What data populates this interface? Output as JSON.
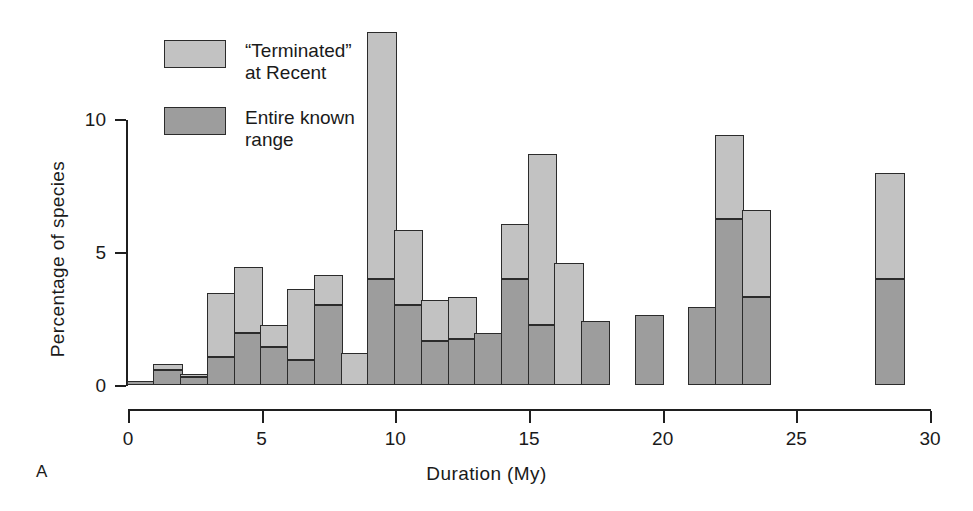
{
  "figure": {
    "panel_label": "A",
    "xlabel": "Duration (My)",
    "ylabel": "Percentage of species"
  },
  "legend": {
    "position": "top-left",
    "items": [
      {
        "label": "“Terminated”\nat Recent",
        "color": "#c2c2c2",
        "key": "terminated"
      },
      {
        "label": "Entire known\nrange",
        "color": "#9d9d9d",
        "key": "entire"
      }
    ]
  },
  "axes": {
    "x": {
      "ticks": [
        "0",
        "5",
        "10",
        "15",
        "20",
        "25",
        "30"
      ],
      "min": 0,
      "max": 30
    },
    "y": {
      "ticks": [
        "0",
        "5",
        "10"
      ],
      "min": 0,
      "max": 14.5
    }
  },
  "chart_data": {
    "type": "bar",
    "title": "",
    "xlabel": "Duration (My)",
    "ylabel": "Percentage of species",
    "xlim": [
      0,
      30
    ],
    "ylim": [
      0,
      14.5
    ],
    "grid": false,
    "legend_position": "top-left",
    "stacked": true,
    "bin_width": 1,
    "categories": [
      "0-1",
      "1-2",
      "2-3",
      "3-4",
      "4-5",
      "5-6",
      "6-7",
      "7-8",
      "8-9",
      "9-10",
      "10-11",
      "11-12",
      "12-13",
      "13-14",
      "14-15",
      "15-16",
      "16-17",
      "17-18",
      "18-19",
      "19-20",
      "20-21",
      "21-22",
      "22-23",
      "23-24",
      "24-25",
      "25-26",
      "26-27",
      "27-28",
      "28-29",
      "29-30"
    ],
    "bin_starts": [
      0,
      1,
      2,
      3,
      4,
      5,
      6,
      7,
      8,
      9,
      10,
      11,
      12,
      13,
      14,
      15,
      16,
      17,
      18,
      19,
      20,
      21,
      22,
      23,
      24,
      25,
      26,
      27,
      28,
      29
    ],
    "series": [
      {
        "name": "Entire known range",
        "color": "#9d9d9d",
        "values": [
          0.15,
          0.55,
          0.3,
          1.05,
          1.95,
          1.45,
          0.95,
          3.0,
          0,
          4.0,
          3.0,
          1.65,
          1.75,
          1.95,
          4.0,
          2.25,
          0,
          2.4,
          0,
          2.65,
          0,
          2.95,
          6.25,
          3.3,
          0,
          0,
          0,
          0,
          4.0,
          0
        ]
      },
      {
        "name": "“Terminated” at Recent",
        "color": "#c2c2c2",
        "values": [
          0,
          0.25,
          0.1,
          2.4,
          2.5,
          0.8,
          2.65,
          1.15,
          1.2,
          9.3,
          2.85,
          1.55,
          1.55,
          0,
          2.05,
          6.45,
          4.6,
          0,
          0,
          0,
          0,
          0,
          3.15,
          3.3,
          0,
          0,
          0,
          0,
          4.0,
          0
        ]
      }
    ],
    "totals": [
      0.15,
      0.8,
      0.4,
      3.45,
      4.45,
      2.25,
      3.6,
      4.15,
      1.2,
      13.3,
      5.85,
      3.2,
      3.3,
      1.95,
      6.05,
      8.7,
      4.6,
      2.4,
      0,
      2.65,
      0,
      2.95,
      9.4,
      6.6,
      0,
      0,
      0,
      0,
      8.0,
      0
    ]
  }
}
